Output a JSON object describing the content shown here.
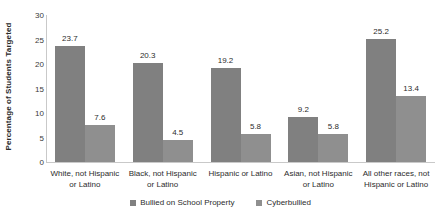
{
  "chart_data": {
    "type": "bar",
    "title": "",
    "xlabel": "",
    "ylabel": "Percentage of Students Targeted",
    "ylim": [
      0,
      30
    ],
    "yticks": [
      0,
      5,
      10,
      15,
      20,
      25,
      30
    ],
    "grid": false,
    "legend_position": "bottom",
    "categories": [
      "White, not Hispanic or Latino",
      "Black, not Hispanic or Latino",
      "Hispanic or Latino",
      "Asian, not Hispanic or Latino",
      "All other races, not Hispanic or Latino"
    ],
    "category_lines": [
      [
        "White, not Hispanic",
        "or Latino"
      ],
      [
        "Black, not Hispanic",
        "or Latino"
      ],
      [
        "Hispanic or Latino",
        ""
      ],
      [
        "Asian, not Hispanic",
        "or Latino"
      ],
      [
        "All other races, not",
        "Hispanic or Latino"
      ]
    ],
    "series": [
      {
        "name": "Bullied on School Property",
        "color": "#808080",
        "values": [
          23.7,
          20.3,
          19.2,
          9.2,
          25.2
        ],
        "labels": [
          "23.7",
          "20.3",
          "19.2",
          "9.2",
          "25.2"
        ]
      },
      {
        "name": "Cyberbullied",
        "color": "#8f8f8f",
        "values": [
          7.6,
          4.5,
          5.8,
          5.8,
          13.4
        ],
        "labels": [
          "7.6",
          "4.5",
          "5.8",
          "5.8",
          "13.4"
        ]
      }
    ]
  }
}
